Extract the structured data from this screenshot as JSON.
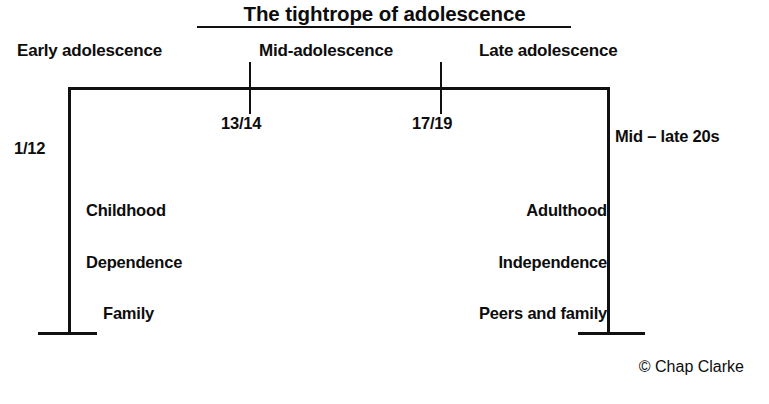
{
  "diagram": {
    "title": "The tightrope of adolescence",
    "credit": "© Chap Clarke",
    "stages": [
      {
        "id": "early",
        "label": "Early adolescence"
      },
      {
        "id": "mid",
        "label": "Mid-adolescence"
      },
      {
        "id": "late",
        "label": "Late adolescence"
      }
    ],
    "ages": [
      {
        "id": "start",
        "label": "1/12"
      },
      {
        "id": "boundary-1",
        "label": "13/14"
      },
      {
        "id": "boundary-2",
        "label": "17/19"
      },
      {
        "id": "end",
        "label": "Mid – late 20s"
      }
    ],
    "left_column": {
      "heading": "Childhood",
      "items": [
        "Dependence",
        "Family"
      ]
    },
    "right_column": {
      "heading": "Adulthood",
      "items": [
        "Independence",
        "Peers and family"
      ]
    },
    "colors": {
      "ink": "#111111",
      "background": "#ffffff"
    }
  }
}
